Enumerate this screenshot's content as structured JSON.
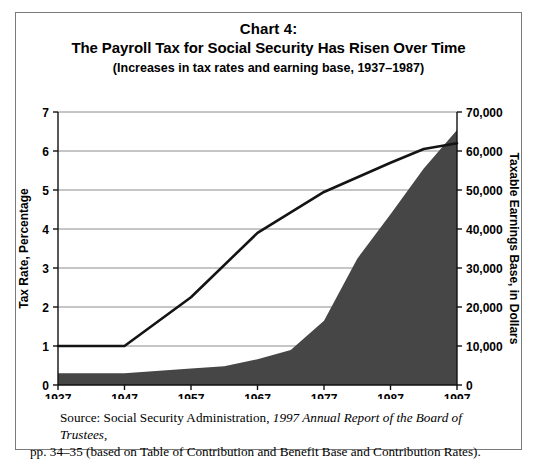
{
  "figure": {
    "title_line1": "Chart 4:",
    "title_line2": "The Payroll Tax for Social Security Has Risen Over Time",
    "title_line3": "(Increases in tax rates and earning base, 1937–1987)",
    "border_color": "#7a7a7a"
  },
  "source": {
    "prefix": "Source: Social Security Administration, ",
    "italic": "1997 Annual Report of the Board of Trustees,",
    "line2": "pp. 34–35 (based on Table of Contribution and Benefit Base and Contribution Rates)."
  },
  "chart_data": {
    "type": "area",
    "title": "The Payroll Tax for Social Security Has Risen Over Time",
    "subtitle": "(Increases in tax rates and earning base, 1937–1987)",
    "xlabel": "Year",
    "ylabel": "Tax Rate, Percentage",
    "y2label": "Taxable Earnings Base, in Dollars",
    "x": [
      1937,
      1947,
      1957,
      1967,
      1977,
      1987,
      1997
    ],
    "xlim": [
      1937,
      1997
    ],
    "xticks": [
      1937,
      1947,
      1957,
      1967,
      1977,
      1987,
      1997
    ],
    "xticklabels": [
      "1937",
      "1947",
      "1957",
      "1967",
      "1977",
      "1987",
      "1997"
    ],
    "ylim": [
      0,
      7
    ],
    "yticks": [
      0,
      1,
      2,
      3,
      4,
      5,
      6,
      7
    ],
    "yticklabels": [
      "0",
      "1",
      "2",
      "3",
      "4",
      "5",
      "6",
      "7"
    ],
    "y2lim": [
      0,
      70000
    ],
    "y2ticks": [
      0,
      10000,
      20000,
      30000,
      40000,
      50000,
      60000,
      70000
    ],
    "y2ticklabels": [
      "0",
      "10,000",
      "20,000",
      "30,000",
      "40,000",
      "50,000",
      "60,000",
      "70,000"
    ],
    "grid": true,
    "legend": "none",
    "series": [
      {
        "name": "Tax Rate, Percentage",
        "kind": "line",
        "axis": "left",
        "color": "#141414",
        "x": [
          1937,
          1947,
          1957,
          1967,
          1977,
          1987,
          1992,
          1997
        ],
        "values": [
          1.0,
          1.0,
          2.25,
          3.9,
          4.95,
          5.7,
          6.05,
          6.2
        ]
      },
      {
        "name": "Taxable Earnings Base, in Dollars",
        "kind": "area",
        "axis": "right",
        "color": "#464646",
        "x": [
          1937,
          1947,
          1957,
          1962,
          1967,
          1972,
          1977,
          1982,
          1987,
          1992,
          1997
        ],
        "values": [
          3000,
          3000,
          4200,
          4800,
          6600,
          9000,
          16500,
          32400,
          43800,
          55500,
          65400
        ]
      }
    ]
  }
}
